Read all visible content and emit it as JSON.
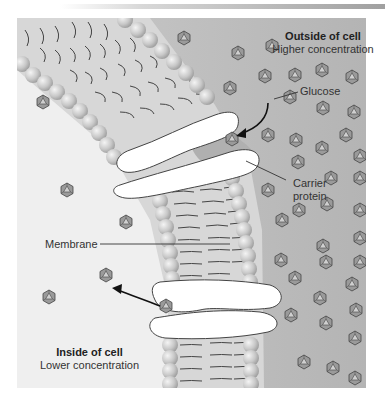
{
  "labels": {
    "outside_title": "Outside of cell",
    "outside_sub": "Higher concentration",
    "inside_title": "Inside of cell",
    "inside_sub": "Lower concentration",
    "glucose": "Glucose",
    "carrier_line1": "Carrier",
    "carrier_line2": "protein",
    "membrane": "Membrane"
  },
  "colors": {
    "outside_bg": "#b9b9b9",
    "inside_bg": "#efefef",
    "membrane_core": "#d6d6d6",
    "head": "#c4c4c4",
    "protein": "#ffffff",
    "glucose": "#8a8a8a",
    "arrow": "#111111"
  },
  "glucose_outside": [
    [
      184,
      38
    ],
    [
      238,
      53
    ],
    [
      272,
      46
    ],
    [
      322,
      70
    ],
    [
      265,
      76
    ],
    [
      295,
      75
    ],
    [
      352,
      77
    ],
    [
      230,
      88
    ],
    [
      290,
      97
    ],
    [
      323,
      108
    ],
    [
      354,
      112
    ],
    [
      346,
      135
    ],
    [
      268,
      135
    ],
    [
      296,
      140
    ],
    [
      322,
      148
    ],
    [
      360,
      156
    ],
    [
      298,
      162
    ],
    [
      331,
      178
    ],
    [
      268,
      190
    ],
    [
      360,
      178
    ],
    [
      299,
      210
    ],
    [
      327,
      204
    ],
    [
      360,
      210
    ],
    [
      282,
      220
    ],
    [
      360,
      238
    ],
    [
      323,
      246
    ],
    [
      281,
      260
    ],
    [
      326,
      262
    ],
    [
      360,
      262
    ],
    [
      295,
      278
    ],
    [
      352,
      284
    ],
    [
      320,
      298
    ],
    [
      356,
      310
    ],
    [
      291,
      315
    ],
    [
      326,
      323
    ],
    [
      355,
      338
    ],
    [
      304,
      362
    ],
    [
      333,
      368
    ],
    [
      355,
      378
    ]
  ],
  "glucose_inside": [
    [
      43,
      102
    ],
    [
      67,
      190
    ],
    [
      126,
      222
    ],
    [
      106,
      275
    ],
    [
      49,
      297
    ]
  ],
  "glucose_in_transit": [
    [
      232,
      139
    ],
    [
      166,
      306
    ]
  ]
}
